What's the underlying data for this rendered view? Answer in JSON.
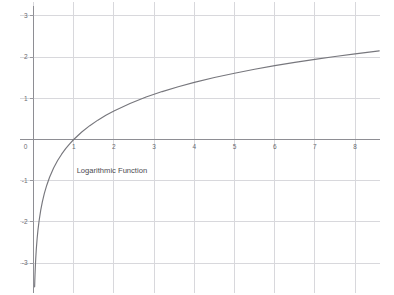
{
  "chart_data": {
    "type": "line",
    "title": "",
    "subtitle": "",
    "xlabel": "",
    "ylabel": "",
    "xlim": [
      -0.25,
      8.65
    ],
    "ylim": [
      -3.55,
      3.15
    ],
    "grid": true,
    "legend": null,
    "legend_position": "none",
    "background_color": "#ffffff",
    "grid_color": "#d8d8dc",
    "axis_color": "#8e8e94",
    "curve_color": "#77777d",
    "tick_label_color": "#6b6b72",
    "annotation_color": "#4a4a50",
    "x_ticks": [
      0,
      1,
      2,
      3,
      4,
      5,
      6,
      7,
      8
    ],
    "x_tick_labels": [
      "0",
      "1",
      "2",
      "3",
      "4",
      "5",
      "6",
      "7",
      "8"
    ],
    "y_ticks": [
      -3,
      -2,
      -1,
      0,
      1,
      2,
      3
    ],
    "y_tick_labels": [
      "-3",
      "-2",
      "-1",
      "0",
      "1",
      "2",
      "3"
    ],
    "annotations": [
      {
        "text": "Logarithmic Function",
        "x": 1.95,
        "y": -0.82
      }
    ],
    "series": [
      {
        "name": "Logarithmic Function",
        "formula": "y = ln(x)",
        "color": "#77777d",
        "x": [
          0.028,
          0.032,
          0.038,
          0.045,
          0.055,
          0.07,
          0.09,
          0.11,
          0.14,
          0.18,
          0.22,
          0.27,
          0.33,
          0.4,
          0.5,
          0.6,
          0.7,
          0.8,
          0.9,
          1.0,
          1.2,
          1.4,
          1.6,
          1.8,
          2.0,
          2.4,
          2.8,
          3.2,
          3.6,
          4.0,
          4.5,
          5.0,
          5.5,
          6.0,
          6.5,
          7.0,
          7.5,
          8.0,
          8.6
        ],
        "y": [
          -3.576,
          -3.442,
          -3.27,
          -3.101,
          -2.9,
          -2.659,
          -2.408,
          -2.207,
          -1.966,
          -1.715,
          -1.514,
          -1.309,
          -1.109,
          -0.916,
          -0.693,
          -0.511,
          -0.357,
          -0.223,
          -0.105,
          0.0,
          0.182,
          0.336,
          0.47,
          0.588,
          0.693,
          0.875,
          1.03,
          1.163,
          1.281,
          1.386,
          1.504,
          1.609,
          1.705,
          1.792,
          1.872,
          1.946,
          2.015,
          2.079,
          2.152
        ]
      }
    ]
  }
}
